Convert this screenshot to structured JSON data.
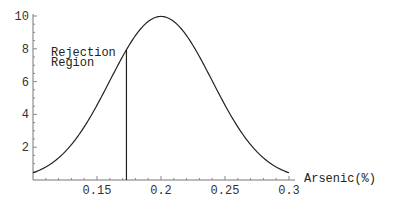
{
  "chart_data": {
    "type": "line",
    "title": "",
    "xlabel": "Arsenic(%)",
    "ylabel": "",
    "xlim": [
      0.1,
      0.3
    ],
    "ylim": [
      0,
      10
    ],
    "grid": false,
    "legend": null,
    "x_ticks": [
      "0.15",
      "0.2",
      "0.25",
      "0.3"
    ],
    "y_ticks": [
      "2",
      "4",
      "6",
      "8",
      "10"
    ],
    "series": [
      {
        "name": "Normal density (mean 0.2, sd 0.04)",
        "mean": 0.2,
        "sd": 0.04,
        "x": [
          0.1,
          0.12,
          0.14,
          0.16,
          0.173,
          0.18,
          0.2,
          0.22,
          0.24,
          0.26,
          0.28,
          0.3
        ],
        "values": [
          0.44,
          1.35,
          3.25,
          6.07,
          7.96,
          8.83,
          9.97,
          8.83,
          6.07,
          3.25,
          1.35,
          0.44
        ]
      }
    ],
    "annotations": [
      {
        "text_line1": "Rejection",
        "text_line2": "Region",
        "x": 0.173,
        "type": "vertical-line"
      }
    ]
  }
}
